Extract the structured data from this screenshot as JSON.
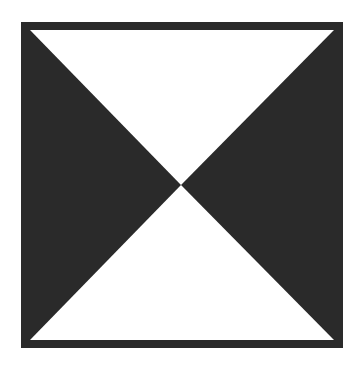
{
  "figure": {
    "colors": {
      "background": "#ffffff",
      "fill": "#2a2a2a",
      "frame": "#2a2a2a"
    },
    "frame": {
      "x": 21,
      "y": 22,
      "width": 322,
      "height": 326,
      "stroke_width": 9
    },
    "center": {
      "x": 181,
      "y": 185
    },
    "shapes": [
      {
        "name": "left-triangle",
        "color": "dark"
      },
      {
        "name": "right-triangle",
        "color": "dark"
      },
      {
        "name": "top-triangle",
        "color": "white"
      },
      {
        "name": "bottom-triangle",
        "color": "white"
      }
    ]
  }
}
